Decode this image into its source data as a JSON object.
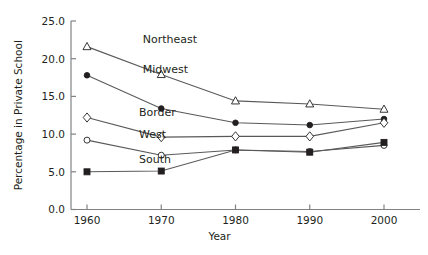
{
  "chart_data": {
    "type": "line",
    "title": "",
    "xlabel": "Year",
    "ylabel": "Percentage in Private School",
    "x": [
      1960,
      1970,
      1980,
      1990,
      2000
    ],
    "xtick_labels": [
      "1960",
      "1970",
      "1980",
      "1990",
      "2000"
    ],
    "ytick_labels": [
      "0.0",
      "5.0",
      "10.0",
      "15.0",
      "20.0",
      "25.0"
    ],
    "ytick_values": [
      0.0,
      5.0,
      10.0,
      15.0,
      20.0,
      25.0
    ],
    "xlim": [
      1955,
      2005
    ],
    "ylim": [
      0,
      25
    ],
    "grid": false,
    "legend_position": "inline-labels",
    "series": [
      {
        "name": "Northeast",
        "marker": "open-triangle",
        "values": [
          21.6,
          17.9,
          14.4,
          14.0,
          13.3
        ],
        "label_x": 1967.5,
        "label_y": 22.6
      },
      {
        "name": "Midwest",
        "marker": "filled-circle",
        "values": [
          17.8,
          13.4,
          11.5,
          11.2,
          12.0
        ],
        "label_x": 1967.5,
        "label_y": 18.6
      },
      {
        "name": "Border",
        "marker": "open-diamond",
        "values": [
          12.2,
          9.6,
          9.7,
          9.7,
          11.5
        ],
        "label_x": 1967.0,
        "label_y": 12.9
      },
      {
        "name": "West",
        "marker": "open-circle",
        "values": [
          9.2,
          7.2,
          7.9,
          7.7,
          8.5
        ],
        "label_x": 1967.0,
        "label_y": 10.0
      },
      {
        "name": "South",
        "marker": "filled-square",
        "values": [
          5.0,
          5.1,
          7.9,
          7.6,
          8.9
        ],
        "label_x": 1967.0,
        "label_y": 6.7
      }
    ]
  },
  "style": {
    "line_color": "#58595b",
    "marker_stroke": "#231f20",
    "marker_fill_open": "#ffffff",
    "marker_fill_closed": "#231f20",
    "axis_color": "#808285",
    "text_color": "#231f20"
  }
}
